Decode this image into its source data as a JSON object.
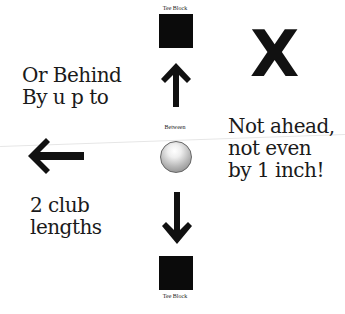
{
  "diagram": {
    "top_block": {
      "label": "Tee Block"
    },
    "bottom_block": {
      "label": "Tee Block"
    },
    "center": {
      "label": "Between",
      "object": "golf-ball"
    },
    "left_text": {
      "top": [
        "Or Behind",
        "By u p to"
      ],
      "bottom": [
        "2 club",
        "lengths"
      ]
    },
    "right_text": {
      "mark": "X",
      "lines": [
        "Not ahead,",
        "not even",
        "by 1 inch!"
      ]
    },
    "arrows": [
      "up-arrow",
      "down-arrow",
      "left-arrow"
    ],
    "colors": {
      "ink": "#111111",
      "block": "#0b0b0b",
      "background": "#ffffff"
    }
  }
}
